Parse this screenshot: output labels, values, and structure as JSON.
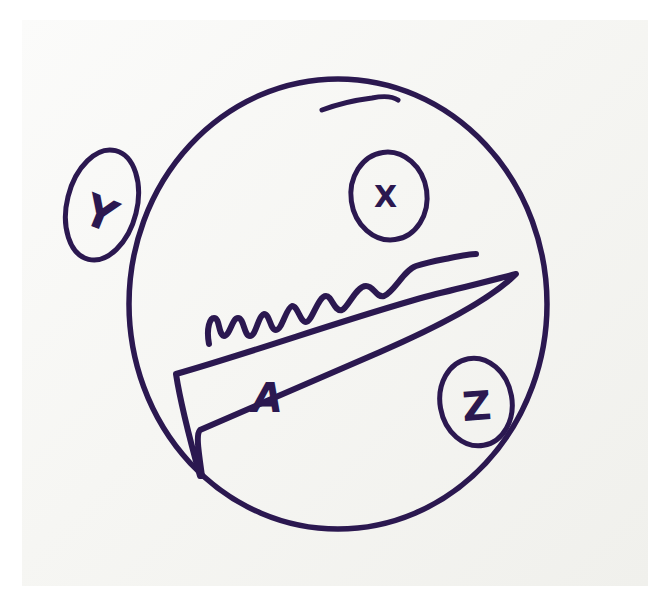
{
  "diagram": {
    "type": "hand-drawn sketch",
    "ink_color": "#2b1850",
    "paper_color": "#f7f7f4",
    "main_circle": {
      "cx": 337,
      "cy": 303,
      "rx": 210,
      "ry": 226
    },
    "labels": {
      "y": {
        "text": "Y",
        "position": "outside circle, upper-left"
      },
      "x": {
        "text": "X",
        "position": "inside circle, top"
      },
      "z": {
        "text": "Z",
        "position": "inside circle, lower-right"
      },
      "a": {
        "text": "A",
        "position": "inside triangle"
      }
    },
    "shapes": [
      "main circle",
      "wavy line",
      "long triangle (wedge)",
      "circled Y",
      "circled X",
      "circled Z"
    ]
  }
}
